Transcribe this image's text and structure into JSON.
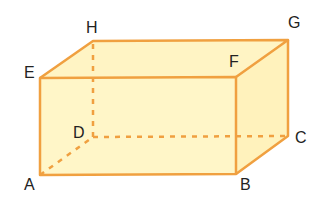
{
  "diagram": {
    "type": "rectangular cuboid",
    "colors": {
      "edge": "#f0a040",
      "face": "#fff6c8",
      "face_side": "#fff2bc",
      "label": "#222222"
    },
    "vertices": {
      "A": {
        "label": "A",
        "x": 40,
        "y": 175
      },
      "B": {
        "label": "B",
        "x": 236,
        "y": 174
      },
      "C": {
        "label": "C",
        "x": 288,
        "y": 136
      },
      "D": {
        "label": "D",
        "x": 93,
        "y": 137
      },
      "E": {
        "label": "E",
        "x": 40,
        "y": 78
      },
      "F": {
        "label": "F",
        "x": 236,
        "y": 77
      },
      "G": {
        "label": "G",
        "x": 288,
        "y": 40
      },
      "H": {
        "label": "H",
        "x": 93,
        "y": 41
      }
    },
    "hidden_edges": [
      "AD",
      "DC",
      "DH"
    ]
  }
}
